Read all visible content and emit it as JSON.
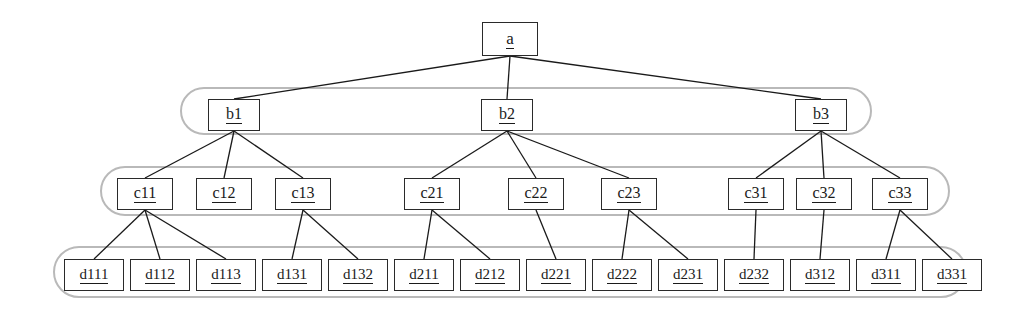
{
  "diagram": {
    "type": "tree",
    "colors": {
      "node_border": "#2a2a2a",
      "node_fill": "#ffffff",
      "edge": "#1a1a1a",
      "group_outline": "#b9b9b9",
      "text": "#1a1a1a",
      "background": "#ffffff"
    },
    "levels": [
      {
        "name": "level-a",
        "grouped": false,
        "nodes": [
          {
            "id": "a",
            "label": "a",
            "x": 482,
            "y": 22,
            "w": 56,
            "h": 34
          }
        ]
      },
      {
        "name": "level-b",
        "grouped": true,
        "group": {
          "x": 181,
          "y": 88,
          "w": 690,
          "h": 46,
          "radius": 23
        },
        "nodes": [
          {
            "id": "b1",
            "label": "b1",
            "x": 208,
            "y": 99,
            "w": 52,
            "h": 32
          },
          {
            "id": "b2",
            "label": "b2",
            "x": 481,
            "y": 99,
            "w": 52,
            "h": 32
          },
          {
            "id": "b3",
            "label": "b3",
            "x": 795,
            "y": 99,
            "w": 52,
            "h": 32
          }
        ]
      },
      {
        "name": "level-c",
        "grouped": true,
        "group": {
          "x": 101,
          "y": 167,
          "w": 848,
          "h": 48,
          "radius": 24
        },
        "nodes": [
          {
            "id": "c11",
            "label": "c11",
            "x": 117,
            "y": 178,
            "w": 56,
            "h": 32
          },
          {
            "id": "c12",
            "label": "c12",
            "x": 196,
            "y": 178,
            "w": 56,
            "h": 32
          },
          {
            "id": "c13",
            "label": "c13",
            "x": 275,
            "y": 178,
            "w": 56,
            "h": 32
          },
          {
            "id": "c21",
            "label": "c21",
            "x": 404,
            "y": 178,
            "w": 56,
            "h": 32
          },
          {
            "id": "c22",
            "label": "c22",
            "x": 508,
            "y": 178,
            "w": 56,
            "h": 32
          },
          {
            "id": "c23",
            "label": "c23",
            "x": 601,
            "y": 178,
            "w": 56,
            "h": 32
          },
          {
            "id": "c31",
            "label": "c31",
            "x": 728,
            "y": 178,
            "w": 56,
            "h": 32
          },
          {
            "id": "c32",
            "label": "c32",
            "x": 796,
            "y": 178,
            "w": 56,
            "h": 32
          },
          {
            "id": "c33",
            "label": "c33",
            "x": 872,
            "y": 178,
            "w": 56,
            "h": 32
          }
        ]
      },
      {
        "name": "level-d",
        "grouped": true,
        "group": {
          "x": 54,
          "y": 247,
          "w": 912,
          "h": 50,
          "radius": 25
        },
        "nodes": [
          {
            "id": "d111",
            "label": "d111",
            "x": 64,
            "y": 259,
            "w": 60,
            "h": 32
          },
          {
            "id": "d112",
            "label": "d112",
            "x": 130,
            "y": 259,
            "w": 60,
            "h": 32
          },
          {
            "id": "d113",
            "label": "d113",
            "x": 196,
            "y": 259,
            "w": 60,
            "h": 32
          },
          {
            "id": "d131",
            "label": "d131",
            "x": 262,
            "y": 259,
            "w": 60,
            "h": 32
          },
          {
            "id": "d132",
            "label": "d132",
            "x": 328,
            "y": 259,
            "w": 60,
            "h": 32
          },
          {
            "id": "d211",
            "label": "d211",
            "x": 394,
            "y": 259,
            "w": 60,
            "h": 32
          },
          {
            "id": "d212",
            "label": "d212",
            "x": 460,
            "y": 259,
            "w": 60,
            "h": 32
          },
          {
            "id": "d221",
            "label": "d221",
            "x": 526,
            "y": 259,
            "w": 60,
            "h": 32
          },
          {
            "id": "d222",
            "label": "d222",
            "x": 592,
            "y": 259,
            "w": 60,
            "h": 32
          },
          {
            "id": "d231",
            "label": "d231",
            "x": 658,
            "y": 259,
            "w": 60,
            "h": 32
          },
          {
            "id": "d232",
            "label": "d232",
            "x": 724,
            "y": 259,
            "w": 60,
            "h": 32
          },
          {
            "id": "d312",
            "label": "d312",
            "x": 790,
            "y": 259,
            "w": 60,
            "h": 32
          },
          {
            "id": "d311",
            "label": "d311",
            "x": 856,
            "y": 259,
            "w": 60,
            "h": 32
          },
          {
            "id": "d331",
            "label": "d331",
            "x": 922,
            "y": 259,
            "w": 60,
            "h": 32
          }
        ]
      }
    ],
    "edges": [
      {
        "from": "a",
        "to": "b1"
      },
      {
        "from": "a",
        "to": "b2"
      },
      {
        "from": "a",
        "to": "b3"
      },
      {
        "from": "b1",
        "to": "c11"
      },
      {
        "from": "b1",
        "to": "c12"
      },
      {
        "from": "b1",
        "to": "c13"
      },
      {
        "from": "b2",
        "to": "c21"
      },
      {
        "from": "b2",
        "to": "c22"
      },
      {
        "from": "b2",
        "to": "c23"
      },
      {
        "from": "b3",
        "to": "c31"
      },
      {
        "from": "b3",
        "to": "c32"
      },
      {
        "from": "b3",
        "to": "c33"
      },
      {
        "from": "c11",
        "to": "d111"
      },
      {
        "from": "c11",
        "to": "d112"
      },
      {
        "from": "c11",
        "to": "d113"
      },
      {
        "from": "c13",
        "to": "d131"
      },
      {
        "from": "c13",
        "to": "d132"
      },
      {
        "from": "c21",
        "to": "d211"
      },
      {
        "from": "c21",
        "to": "d212"
      },
      {
        "from": "c22",
        "to": "d221"
      },
      {
        "from": "c23",
        "to": "d222"
      },
      {
        "from": "c23",
        "to": "d231"
      },
      {
        "from": "c31",
        "to": "d232"
      },
      {
        "from": "c32",
        "to": "d312"
      },
      {
        "from": "c33",
        "to": "d311"
      },
      {
        "from": "c33",
        "to": "d331"
      }
    ]
  }
}
